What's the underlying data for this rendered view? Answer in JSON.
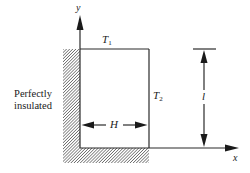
{
  "figure": {
    "side_label": {
      "line1": "Perfectly",
      "line2": "insulated"
    },
    "axes": {
      "x_label": "x",
      "y_label": "y"
    },
    "boundaries": {
      "top": {
        "symbol": "T",
        "subscript": "1"
      },
      "right": {
        "symbol": "T",
        "subscript": "2"
      }
    },
    "dimensions": {
      "width": "H",
      "height": "l"
    },
    "colors": {
      "line": "#2a2a2a",
      "hatch": "#555555",
      "background": "#ffffff"
    }
  }
}
